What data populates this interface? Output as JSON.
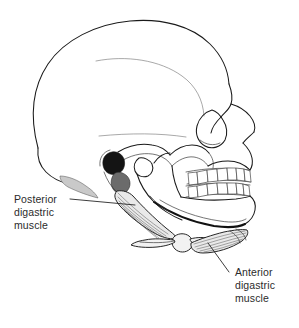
{
  "figure": {
    "name": "digastric-muscle-skull-lateral-view",
    "background_color": "#ffffff",
    "line_color": "#1a1a1a",
    "text_color": "#2b2b2b",
    "width": 299,
    "height": 328
  },
  "labels": {
    "posterior": {
      "line1": "Posterior",
      "line2": "digastric",
      "line3": "muscle"
    },
    "anterior": {
      "line1": "Anterior",
      "line2": "digastric",
      "line3": "muscle"
    }
  },
  "structures": {
    "cranium": "cranial-vault",
    "frontal_bone": "frontal-bone",
    "orbit": "orbit",
    "nasal_aperture": "nasal-aperture",
    "zygomatic_arch": "zygomatic-arch",
    "external_auditory_meatus": "external-auditory-meatus",
    "mastoid_process": "mastoid-process",
    "mandible": "mandible",
    "maxilla": "maxilla",
    "hyoid_bone": "hyoid-bone",
    "upper_teeth": "upper-teeth-row",
    "lower_teeth": "lower-teeth-row",
    "posterior_digastric_belly": "posterior-digastric-belly",
    "anterior_digastric_belly": "anterior-digastric-belly"
  }
}
